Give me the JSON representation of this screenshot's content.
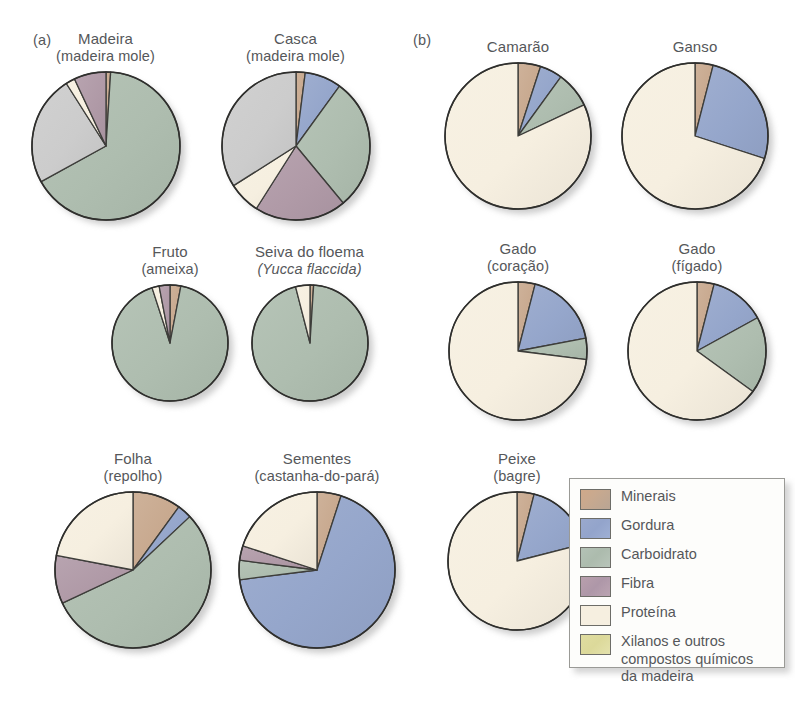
{
  "panels": {
    "a_label": "(a)",
    "b_label": "(b)"
  },
  "legend": {
    "items": [
      {
        "key": "minerais",
        "label": "Minerais",
        "color": "#c8a98f"
      },
      {
        "key": "gordura",
        "label": "Gordura",
        "color": "#95a6cb"
      },
      {
        "key": "carboidrato",
        "label": "Carboidrato",
        "color": "#aebdaf"
      },
      {
        "key": "fibra",
        "label": "Fibra",
        "color": "#b09aa7"
      },
      {
        "key": "proteina",
        "label": "Proteína",
        "color": "#f6efe0"
      },
      {
        "key": "xilanos",
        "label": "Xilanos e outros\ncompostos químicos\nda madeira",
        "color": "#ded99f"
      }
    ]
  },
  "chart_data": [
    {
      "id": "madeira",
      "type": "pie",
      "title": "Madeira",
      "subtitle": "(madeira mole)",
      "subtitle_italic": false,
      "panel": "a",
      "categories": [
        "Minerais",
        "Carboidrato",
        "Xilanos e outros compostos químicos da madeira",
        "Proteína",
        "Fibra"
      ],
      "values": [
        1,
        66,
        24,
        2,
        7
      ]
    },
    {
      "id": "casca",
      "type": "pie",
      "title": "Casca",
      "subtitle": "(madeira mole)",
      "subtitle_italic": false,
      "panel": "a",
      "categories": [
        "Minerais",
        "Gordura",
        "Carboidrato",
        "Fibra",
        "Proteína",
        "Xilanos e outros compostos químicos da madeira"
      ],
      "values": [
        2,
        8,
        29,
        20,
        7,
        34
      ]
    },
    {
      "id": "fruto",
      "type": "pie",
      "title": "Fruto",
      "subtitle": "(ameixa)",
      "subtitle_italic": false,
      "panel": "a",
      "categories": [
        "Minerais",
        "Carboidrato",
        "Proteína",
        "Fibra"
      ],
      "values": [
        3,
        92,
        2,
        3
      ]
    },
    {
      "id": "seiva",
      "type": "pie",
      "title": "Seiva do floema",
      "subtitle": "(Yucca flaccida)",
      "subtitle_italic": true,
      "panel": "a",
      "categories": [
        "Minerais",
        "Carboidrato",
        "Proteína"
      ],
      "values": [
        1,
        95,
        4
      ]
    },
    {
      "id": "folha",
      "type": "pie",
      "title": "Folha",
      "subtitle": "(repolho)",
      "subtitle_italic": false,
      "panel": "a",
      "categories": [
        "Minerais",
        "Gordura",
        "Carboidrato",
        "Fibra",
        "Proteína"
      ],
      "values": [
        10,
        3,
        55,
        10,
        22
      ]
    },
    {
      "id": "sementes",
      "type": "pie",
      "title": "Sementes",
      "subtitle": "(castanha-do-pará)",
      "subtitle_italic": false,
      "panel": "a",
      "categories": [
        "Minerais",
        "Gordura",
        "Carboidrato",
        "Fibra",
        "Proteína"
      ],
      "values": [
        5,
        68,
        4,
        3,
        20
      ]
    },
    {
      "id": "camarao",
      "type": "pie",
      "title": "Camarão",
      "subtitle": "",
      "subtitle_italic": false,
      "panel": "b",
      "categories": [
        "Minerais",
        "Gordura",
        "Carboidrato",
        "Proteína"
      ],
      "values": [
        5,
        5,
        8,
        82
      ]
    },
    {
      "id": "ganso",
      "type": "pie",
      "title": "Ganso",
      "subtitle": "",
      "subtitle_italic": false,
      "panel": "b",
      "categories": [
        "Minerais",
        "Gordura",
        "Proteína"
      ],
      "values": [
        4,
        26,
        70
      ]
    },
    {
      "id": "gado-coracao",
      "type": "pie",
      "title": "Gado",
      "subtitle": "(coração)",
      "subtitle_italic": false,
      "panel": "b",
      "categories": [
        "Minerais",
        "Gordura",
        "Carboidrato",
        "Proteína"
      ],
      "values": [
        4,
        18,
        5,
        73
      ]
    },
    {
      "id": "gado-figado",
      "type": "pie",
      "title": "Gado",
      "subtitle": "(fígado)",
      "subtitle_italic": false,
      "panel": "b",
      "categories": [
        "Minerais",
        "Gordura",
        "Carboidrato",
        "Proteína"
      ],
      "values": [
        4,
        13,
        18,
        65
      ]
    },
    {
      "id": "peixe",
      "type": "pie",
      "title": "Peixe",
      "subtitle": "(bagre)",
      "subtitle_italic": false,
      "panel": "b",
      "categories": [
        "Minerais",
        "Gordura",
        "Proteína"
      ],
      "values": [
        4,
        17,
        79
      ]
    }
  ],
  "layout": {
    "charts": {
      "madeira": {
        "left": 18,
        "top": 30,
        "width": 175,
        "radius": 74
      },
      "casca": {
        "left": 208,
        "top": 30,
        "width": 175,
        "radius": 74
      },
      "fruto": {
        "left": 95,
        "top": 243,
        "width": 150,
        "radius": 58
      },
      "seiva": {
        "left": 222,
        "top": 243,
        "width": 175,
        "radius": 58
      },
      "folha": {
        "left": 48,
        "top": 450,
        "width": 170,
        "radius": 78
      },
      "sementes": {
        "left": 217,
        "top": 450,
        "width": 200,
        "radius": 78
      },
      "camarao": {
        "left": 438,
        "top": 38,
        "width": 160,
        "radius": 73
      },
      "ganso": {
        "left": 615,
        "top": 38,
        "width": 160,
        "radius": 73
      },
      "gado-coracao": {
        "left": 438,
        "top": 240,
        "width": 160,
        "radius": 69
      },
      "gado-figado": {
        "left": 617,
        "top": 240,
        "width": 160,
        "radius": 69
      },
      "peixe": {
        "left": 437,
        "top": 450,
        "width": 160,
        "radius": 69
      }
    },
    "panel_a_tag": {
      "left": 33,
      "top": 32
    },
    "panel_b_tag": {
      "left": 413,
      "top": 32
    },
    "legend_box": {
      "left": 569,
      "top": 478,
      "width": 216,
      "height": 190
    }
  }
}
